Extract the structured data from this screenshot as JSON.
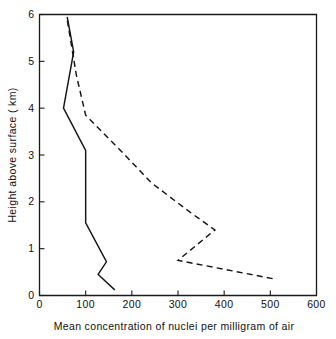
{
  "figure": {
    "title": "",
    "background": "#ffffff",
    "ink_color": "#151515"
  },
  "axes": {
    "x": {
      "label": "Mean concentration of nuclei  per milligram of air",
      "min": 0,
      "max": 600,
      "ticks": [
        0,
        100,
        200,
        300,
        400,
        500,
        600
      ],
      "tick_labels": [
        "0",
        "100",
        "200",
        "300",
        "400",
        "500",
        "600"
      ]
    },
    "y": {
      "label": "Height above surface ( km)",
      "min": 0,
      "max": 6,
      "ticks": [
        0,
        1,
        2,
        3,
        4,
        5,
        6
      ],
      "tick_labels": [
        "0",
        "1",
        "2",
        "3",
        "4",
        "5",
        "6"
      ]
    },
    "grid": false,
    "legend": "none"
  },
  "chart_data": {
    "type": "line",
    "title": "",
    "xlabel": "Mean concentration of nuclei  per milligram of air",
    "ylabel": "Height above surface ( km)",
    "xlim": [
      0,
      600
    ],
    "ylim": [
      0,
      6
    ],
    "xticks": [
      0,
      100,
      200,
      300,
      400,
      500,
      600
    ],
    "yticks": [
      0,
      1,
      2,
      3,
      4,
      5,
      6
    ],
    "grid": false,
    "legend_position": "none",
    "orientation": "x-is-concentration, y-is-height",
    "series": [
      {
        "name": "solid-profile",
        "style": "solid",
        "color": "#151515",
        "x": [
          163,
          127,
          145,
          100,
          100,
          52,
          74,
          60
        ],
        "y": [
          0.12,
          0.45,
          0.72,
          1.55,
          3.1,
          4.0,
          5.2,
          5.95
        ],
        "points": [
          {
            "concentration": 163,
            "height": 0.12
          },
          {
            "concentration": 127,
            "height": 0.45
          },
          {
            "concentration": 145,
            "height": 0.72
          },
          {
            "concentration": 100,
            "height": 1.55
          },
          {
            "concentration": 100,
            "height": 3.1
          },
          {
            "concentration": 52,
            "height": 4.0
          },
          {
            "concentration": 74,
            "height": 5.2
          },
          {
            "concentration": 60,
            "height": 5.95
          }
        ]
      },
      {
        "name": "dashed-profile",
        "style": "dashed",
        "color": "#151515",
        "x": [
          505,
          300,
          380,
          330,
          243,
          185,
          130,
          100,
          80,
          59
        ],
        "y": [
          0.36,
          0.75,
          1.4,
          1.75,
          2.4,
          3.0,
          3.55,
          3.85,
          4.7,
          5.95
        ],
        "points": [
          {
            "concentration": 505,
            "height": 0.36
          },
          {
            "concentration": 300,
            "height": 0.75
          },
          {
            "concentration": 380,
            "height": 1.4
          },
          {
            "concentration": 330,
            "height": 1.75
          },
          {
            "concentration": 243,
            "height": 2.4
          },
          {
            "concentration": 185,
            "height": 3.0
          },
          {
            "concentration": 130,
            "height": 3.55
          },
          {
            "concentration": 100,
            "height": 3.85
          },
          {
            "concentration": 80,
            "height": 4.7
          },
          {
            "concentration": 59,
            "height": 5.95
          }
        ]
      }
    ]
  }
}
